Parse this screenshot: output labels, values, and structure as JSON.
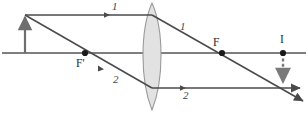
{
  "figure": {
    "kind": "thin-lens-ray-diagram",
    "width": 308,
    "height": 113,
    "background_color": "#ffffff"
  },
  "colors": {
    "axis": "#555555",
    "ray": "#4a4a4a",
    "object_arrow": "#6e6e6e",
    "image_arrow": "#7a7a7a",
    "lens_fill": "#e2e2e2",
    "lens_stroke": "#9a9a9a",
    "point_dot": "#1a1a1a",
    "label_text": "#2b2b2b"
  },
  "labels": {
    "ray1_incident": "1",
    "ray1_refracted": "1",
    "ray2_incident": "2",
    "ray2_refracted": "2",
    "focal_near": "F'",
    "focal_far": "F",
    "image_point": "I"
  },
  "geometry": {
    "optical_axis": {
      "y": 53,
      "x_start": 2,
      "x_end": 306
    },
    "lens": {
      "center_x": 152,
      "top_y": 3,
      "bottom_y": 110,
      "half_width": 12
    },
    "object": {
      "x": 25,
      "base_y": 53,
      "tip_y": 15,
      "direction": "up"
    },
    "image": {
      "x": 283,
      "base_y": 53,
      "tip_y": 80,
      "direction": "down",
      "style": "dashed"
    },
    "focal_point_near": {
      "x": 85,
      "y": 53
    },
    "focal_point_far": {
      "x": 222,
      "y": 53
    },
    "image_point": {
      "x": 283,
      "y": 53
    },
    "ray1": {
      "incident": {
        "x1": 25,
        "y1": 15,
        "x2": 152,
        "y2": 15
      },
      "refracted": {
        "x1": 152,
        "y1": 15,
        "x2": 303,
        "y2": 101
      },
      "marker_x": 108,
      "label_x": 112,
      "label_y": 2
    },
    "ray2": {
      "incident": {
        "x1": 25,
        "y1": 15,
        "x2": 152,
        "y2": 88
      },
      "refracted": {
        "x1": 152,
        "y1": 88,
        "x2": 300,
        "y2": 88
      },
      "marker_x": 184,
      "label_x": 118,
      "label_y": 70
    }
  },
  "annotations": {
    "description_ray1": "Ray parallel to the axis refracts through the far focal point F",
    "description_ray2": "Ray through the near focal point F' emerges parallel to the axis",
    "image_type": "real inverted image at I"
  }
}
